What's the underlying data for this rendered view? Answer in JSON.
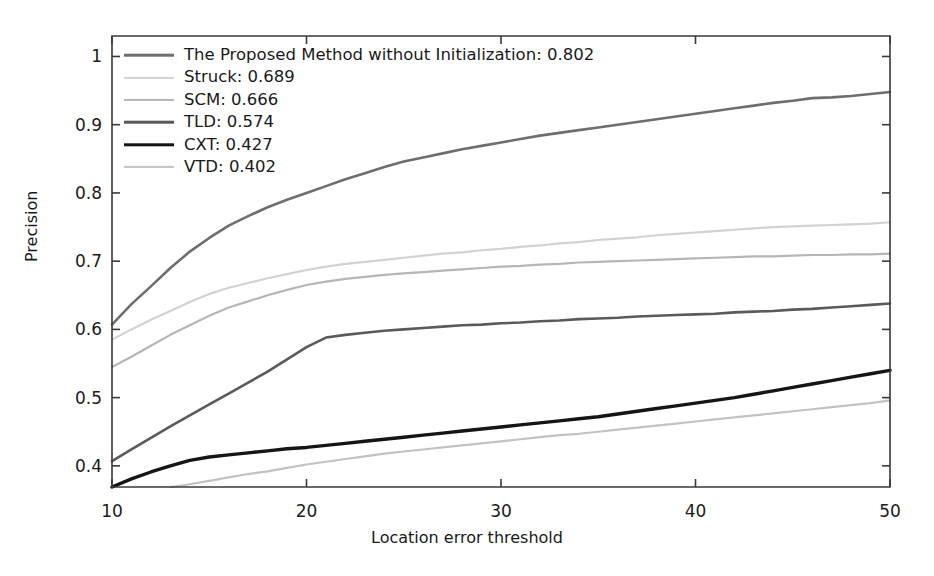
{
  "chart_data": {
    "type": "line",
    "title": "",
    "xlabel": "Location error threshold",
    "ylabel": "Precision",
    "xlim": [
      10,
      50
    ],
    "ylim": [
      0.369,
      1.03
    ],
    "xticks": [
      10,
      20,
      30,
      40,
      50
    ],
    "xtick_labels": [
      "10",
      "20",
      "30",
      "40",
      "50"
    ],
    "yticks": [
      0.4,
      0.5,
      0.6,
      0.7,
      0.8,
      0.9,
      1.0
    ],
    "ytick_labels": [
      "0.4",
      "0.5",
      "0.6",
      "0.7",
      "0.8",
      "0.9",
      "1"
    ],
    "grid": false,
    "legend_position": "upper-left-inside",
    "x": [
      10,
      11,
      12,
      13,
      14,
      15,
      16,
      17,
      18,
      19,
      20,
      21,
      22,
      23,
      24,
      25,
      26,
      27,
      28,
      29,
      30,
      31,
      32,
      33,
      34,
      35,
      36,
      37,
      38,
      39,
      40,
      41,
      42,
      43,
      44,
      45,
      46,
      47,
      48,
      49,
      50
    ],
    "series": [
      {
        "name": "The Proposed Method without Initialization",
        "legend_label": "The Proposed Method without Initialization: 0.802",
        "score": 0.802,
        "color": "#6e6e6e",
        "width": 2.6,
        "values": [
          0.607,
          0.637,
          0.663,
          0.69,
          0.714,
          0.734,
          0.752,
          0.766,
          0.779,
          0.79,
          0.8,
          0.81,
          0.82,
          0.829,
          0.838,
          0.846,
          0.852,
          0.858,
          0.864,
          0.869,
          0.874,
          0.879,
          0.884,
          0.888,
          0.892,
          0.896,
          0.9,
          0.904,
          0.908,
          0.912,
          0.916,
          0.92,
          0.924,
          0.928,
          0.932,
          0.935,
          0.939,
          0.94,
          0.942,
          0.945,
          0.948
        ]
      },
      {
        "name": "Struck",
        "legend_label": "Struck: 0.689",
        "score": 0.689,
        "color": "#d2d2d2",
        "width": 2.2,
        "values": [
          0.585,
          0.6,
          0.614,
          0.627,
          0.64,
          0.652,
          0.661,
          0.668,
          0.675,
          0.681,
          0.687,
          0.692,
          0.696,
          0.699,
          0.702,
          0.705,
          0.708,
          0.711,
          0.713,
          0.716,
          0.718,
          0.721,
          0.723,
          0.726,
          0.728,
          0.731,
          0.733,
          0.735,
          0.738,
          0.74,
          0.742,
          0.744,
          0.746,
          0.748,
          0.75,
          0.751,
          0.752,
          0.753,
          0.754,
          0.755,
          0.757
        ]
      },
      {
        "name": "SCM",
        "legend_label": "SCM: 0.666",
        "score": 0.666,
        "color": "#b6b6b6",
        "width": 2.2,
        "values": [
          0.545,
          0.56,
          0.576,
          0.592,
          0.606,
          0.62,
          0.632,
          0.641,
          0.65,
          0.658,
          0.665,
          0.67,
          0.674,
          0.677,
          0.68,
          0.682,
          0.684,
          0.686,
          0.688,
          0.69,
          0.692,
          0.693,
          0.695,
          0.696,
          0.698,
          0.699,
          0.7,
          0.701,
          0.702,
          0.703,
          0.704,
          0.705,
          0.706,
          0.707,
          0.707,
          0.708,
          0.709,
          0.709,
          0.71,
          0.71,
          0.711
        ]
      },
      {
        "name": "TLD",
        "legend_label": "TLD: 0.574",
        "score": 0.574,
        "color": "#5a5a5a",
        "width": 2.6,
        "values": [
          0.407,
          0.424,
          0.441,
          0.458,
          0.474,
          0.49,
          0.506,
          0.522,
          0.538,
          0.556,
          0.574,
          0.588,
          0.592,
          0.595,
          0.598,
          0.6,
          0.602,
          0.604,
          0.606,
          0.607,
          0.609,
          0.61,
          0.612,
          0.613,
          0.615,
          0.616,
          0.617,
          0.619,
          0.62,
          0.621,
          0.622,
          0.623,
          0.625,
          0.626,
          0.627,
          0.629,
          0.63,
          0.632,
          0.634,
          0.636,
          0.638
        ]
      },
      {
        "name": "CXT",
        "legend_label": "CXT: 0.427",
        "score": 0.427,
        "color": "#151515",
        "width": 3.4,
        "values": [
          0.369,
          0.381,
          0.391,
          0.4,
          0.408,
          0.413,
          0.416,
          0.419,
          0.422,
          0.425,
          0.427,
          0.43,
          0.433,
          0.436,
          0.439,
          0.442,
          0.445,
          0.448,
          0.451,
          0.454,
          0.457,
          0.46,
          0.463,
          0.466,
          0.469,
          0.472,
          0.476,
          0.48,
          0.484,
          0.488,
          0.492,
          0.496,
          0.5,
          0.505,
          0.51,
          0.515,
          0.52,
          0.525,
          0.53,
          0.535,
          0.54
        ]
      },
      {
        "name": "VTD",
        "legend_label": "VTD: 0.402",
        "score": 0.402,
        "color": "#c2c2c2",
        "width": 2.2,
        "values": [
          null,
          null,
          null,
          0.369,
          0.373,
          0.378,
          0.383,
          0.388,
          0.392,
          0.397,
          0.402,
          0.406,
          0.41,
          0.414,
          0.418,
          0.421,
          0.424,
          0.427,
          0.43,
          0.433,
          0.436,
          0.439,
          0.442,
          0.445,
          0.447,
          0.45,
          0.453,
          0.456,
          0.459,
          0.462,
          0.465,
          0.468,
          0.471,
          0.474,
          0.477,
          0.48,
          0.483,
          0.486,
          0.489,
          0.492,
          0.496
        ]
      }
    ]
  },
  "axes": {
    "spine_color": "#3a3a3a",
    "tick_color": "#3a3a3a"
  }
}
